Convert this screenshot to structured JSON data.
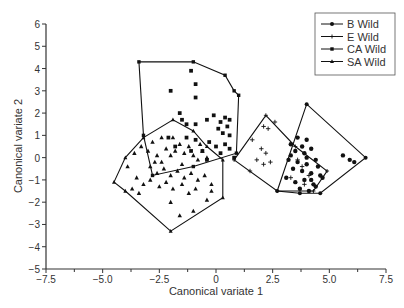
{
  "chart_data": {
    "type": "scatter",
    "title": "",
    "xlabel": "Canonical variate 1",
    "ylabel": "Canonical variate 2",
    "xlim": [
      -7.5,
      7.5
    ],
    "ylim": [
      -5,
      6
    ],
    "xticks": [
      -7.5,
      -5.0,
      -2.5,
      0,
      2.5,
      5.0,
      7.5
    ],
    "xtick_labels": [
      "−7.5",
      "−5.0",
      "−2.5",
      "0",
      "2.5",
      "5.0",
      "7.5"
    ],
    "yticks": [
      -5,
      -4,
      -3,
      -2,
      -1,
      0,
      1,
      2,
      3,
      4,
      5,
      6
    ],
    "ytick_labels": [
      "−5",
      "−4",
      "−3",
      "−2",
      "−1",
      "0",
      "1",
      "2",
      "3",
      "4",
      "5",
      "6"
    ],
    "grid": false,
    "legend_position": "upper right",
    "series": [
      {
        "name": "B Wild",
        "marker": "circle",
        "hull": [
          [
            2.7,
            -1.5
          ],
          [
            4.0,
            2.4
          ],
          [
            6.6,
            0.0
          ],
          [
            4.6,
            -1.6
          ],
          [
            3.7,
            -1.6
          ]
        ],
        "points": [
          [
            3.3,
            0.6
          ],
          [
            3.6,
            0.9
          ],
          [
            3.8,
            0.5
          ],
          [
            4.0,
            0.8
          ],
          [
            3.5,
            0.3
          ],
          [
            3.9,
            0.2
          ],
          [
            4.2,
            0.4
          ],
          [
            3.2,
            -0.1
          ],
          [
            3.6,
            -0.2
          ],
          [
            4.0,
            -0.3
          ],
          [
            4.4,
            -0.1
          ],
          [
            3.4,
            -0.5
          ],
          [
            3.8,
            -0.6
          ],
          [
            4.2,
            -0.7
          ],
          [
            4.5,
            -0.4
          ],
          [
            3.1,
            -0.9
          ],
          [
            3.5,
            -1.1
          ],
          [
            3.9,
            -1.0
          ],
          [
            4.3,
            -1.2
          ],
          [
            4.6,
            -0.8
          ],
          [
            3.7,
            -1.4
          ],
          [
            4.1,
            -1.5
          ],
          [
            4.4,
            -1.3
          ],
          [
            4.0,
            0.0
          ],
          [
            3.3,
            0.1
          ],
          [
            5.6,
            0.1
          ],
          [
            5.9,
            -0.1
          ],
          [
            6.1,
            -0.2
          ],
          [
            4.7,
            -0.9
          ],
          [
            4.2,
            -1.0
          ]
        ]
      },
      {
        "name": "E Wild",
        "marker": "plus",
        "hull": [
          [
            0.8,
            -0.1
          ],
          [
            2.2,
            1.9
          ],
          [
            3.5,
            0.5
          ],
          [
            4.9,
            -0.6
          ],
          [
            4.3,
            -1.5
          ],
          [
            2.7,
            -1.5
          ]
        ],
        "points": [
          [
            2.1,
            1.4
          ],
          [
            2.3,
            1.3
          ],
          [
            2.6,
            1.6
          ],
          [
            1.6,
            0.8
          ],
          [
            2.0,
            0.4
          ],
          [
            2.2,
            0.2
          ],
          [
            1.8,
            -0.1
          ],
          [
            2.1,
            -0.3
          ],
          [
            1.5,
            -0.6
          ],
          [
            2.4,
            -0.2
          ],
          [
            3.6,
            -0.1
          ],
          [
            3.8,
            -0.4
          ],
          [
            4.1,
            -0.8
          ],
          [
            3.3,
            -0.9
          ],
          [
            3.9,
            -1.2
          ]
        ]
      },
      {
        "name": "CA Wild",
        "marker": "square",
        "hull": [
          [
            -3.4,
            4.3
          ],
          [
            -1.0,
            4.3
          ],
          [
            0.4,
            3.7
          ],
          [
            0.8,
            3.0
          ],
          [
            1.0,
            2.8
          ],
          [
            0.9,
            0.2
          ],
          [
            -1.0,
            -0.4
          ],
          [
            -2.8,
            -0.8
          ],
          [
            -3.2,
            1.0
          ]
        ],
        "points": [
          [
            -1.1,
            3.9
          ],
          [
            -2.0,
            3.0
          ],
          [
            -0.9,
            3.3
          ],
          [
            -0.9,
            2.7
          ],
          [
            -1.6,
            2.0
          ],
          [
            -1.5,
            1.7
          ],
          [
            -1.3,
            1.5
          ],
          [
            -0.9,
            1.5
          ],
          [
            -0.4,
            1.7
          ],
          [
            -0.1,
            1.9
          ],
          [
            0.2,
            1.6
          ],
          [
            0.4,
            1.8
          ],
          [
            0.6,
            1.7
          ],
          [
            0.1,
            1.3
          ],
          [
            0.3,
            1.1
          ],
          [
            0.5,
            1.4
          ],
          [
            -2.1,
            0.9
          ],
          [
            -1.3,
            0.9
          ],
          [
            -0.9,
            0.8
          ],
          [
            -0.3,
            0.7
          ],
          [
            0.0,
            0.5
          ],
          [
            0.4,
            0.6
          ],
          [
            0.6,
            0.4
          ],
          [
            -1.8,
            0.5
          ],
          [
            -0.6,
            0.3
          ],
          [
            0.2,
            0.2
          ],
          [
            -0.4,
            -0.1
          ],
          [
            0.8,
            0.0
          ],
          [
            -1.1,
            0.3
          ],
          [
            0.6,
            1.0
          ]
        ]
      },
      {
        "name": "SA Wild",
        "marker": "triangle",
        "hull": [
          [
            -4.5,
            -1.1
          ],
          [
            -4.0,
            0.0
          ],
          [
            -3.2,
            0.9
          ],
          [
            -1.9,
            1.7
          ],
          [
            -1.0,
            1.2
          ],
          [
            -0.4,
            0.5
          ],
          [
            0.3,
            -0.1
          ],
          [
            0.3,
            -1.8
          ],
          [
            -2.0,
            -3.3
          ],
          [
            -4.0,
            -1.5
          ]
        ],
        "points": [
          [
            -3.9,
            -0.4
          ],
          [
            -3.6,
            0.2
          ],
          [
            -3.3,
            0.5
          ],
          [
            -3.0,
            0.3
          ],
          [
            -2.8,
            0.7
          ],
          [
            -2.6,
            0.1
          ],
          [
            -2.4,
            -0.2
          ],
          [
            -2.2,
            0.4
          ],
          [
            -2.0,
            0.1
          ],
          [
            -1.8,
            0.3
          ],
          [
            -1.6,
            0.6
          ],
          [
            -1.4,
            0.2
          ],
          [
            -1.2,
            0.5
          ],
          [
            -1.0,
            0.1
          ],
          [
            -0.8,
            -0.1
          ],
          [
            -0.6,
            0.3
          ],
          [
            -0.4,
            0.0
          ],
          [
            -2.9,
            -0.4
          ],
          [
            -2.6,
            -0.7
          ],
          [
            -2.3,
            -0.5
          ],
          [
            -2.0,
            -0.8
          ],
          [
            -1.7,
            -0.6
          ],
          [
            -1.4,
            -0.9
          ],
          [
            -1.1,
            -0.7
          ],
          [
            -0.8,
            -1.0
          ],
          [
            -0.5,
            -0.8
          ],
          [
            -3.5,
            -0.9
          ],
          [
            -3.2,
            -1.2
          ],
          [
            -2.9,
            -1.0
          ],
          [
            -2.5,
            -1.3
          ],
          [
            -2.2,
            -1.1
          ],
          [
            -1.9,
            -1.4
          ],
          [
            -1.5,
            -1.2
          ],
          [
            -1.2,
            -1.6
          ],
          [
            -0.9,
            -1.4
          ],
          [
            -0.2,
            -1.5
          ],
          [
            -0.4,
            -1.9
          ],
          [
            -2.0,
            -2.0
          ],
          [
            -1.0,
            -2.4
          ],
          [
            -1.6,
            -2.6
          ],
          [
            -3.7,
            -1.4
          ],
          [
            -3.4,
            -1.6
          ],
          [
            -2.7,
            -0.2
          ],
          [
            -1.5,
            -0.3
          ],
          [
            -0.7,
            0.6
          ],
          [
            -1.9,
            0.9
          ],
          [
            -0.2,
            -1.2
          ],
          [
            -2.4,
            0.9
          ]
        ]
      }
    ]
  },
  "legend": {
    "items": [
      {
        "label": "B Wild",
        "marker": "circle"
      },
      {
        "label": "E Wild",
        "marker": "plus"
      },
      {
        "label": "CA Wild",
        "marker": "square"
      },
      {
        "label": "SA Wild",
        "marker": "triangle"
      }
    ]
  },
  "colors": {
    "ink": "#111111",
    "axis": "#333333",
    "background": "#ffffff"
  }
}
